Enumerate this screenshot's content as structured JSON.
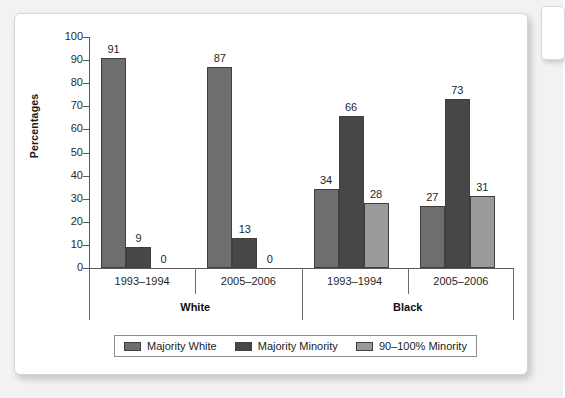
{
  "chart_data": {
    "type": "bar",
    "title": "",
    "subtitle": "",
    "xlabel": "",
    "ylabel": "Percentages",
    "ylim": [
      0,
      100
    ],
    "ytick_labels": [
      "100",
      "90",
      "80",
      "70",
      "60",
      "50",
      "40",
      "30",
      "20",
      "10",
      "0"
    ],
    "ytick_values": [
      100,
      90,
      80,
      70,
      60,
      50,
      40,
      30,
      20,
      10,
      0
    ],
    "grid": false,
    "legend_position": "bottom",
    "groups": [
      {
        "name": "White",
        "categories": [
          "1993–1994",
          "2005–2006"
        ]
      },
      {
        "name": "Black",
        "categories": [
          "1993–1994",
          "2005–2006"
        ]
      }
    ],
    "categories": [
      "1993–1994",
      "2005–2006",
      "1993–1994",
      "2005–2006"
    ],
    "series": [
      {
        "name": "Majority White",
        "color": "#6e6e6e",
        "values": [
          91,
          87,
          34,
          27
        ]
      },
      {
        "name": "Majority Minority",
        "color": "#474747",
        "values": [
          9,
          13,
          66,
          73
        ]
      },
      {
        "name": "90–100% Minority",
        "color": "#9a9a9a",
        "values": [
          0,
          0,
          28,
          31
        ]
      }
    ],
    "bars": [
      {
        "group": "White",
        "category": "1993–1994",
        "series": "Majority White",
        "value": 91,
        "label": "91"
      },
      {
        "group": "White",
        "category": "1993–1994",
        "series": "Majority Minority",
        "value": 9,
        "label": "9"
      },
      {
        "group": "White",
        "category": "1993–1994",
        "series": "90–100% Minority",
        "value": 0,
        "label": "0"
      },
      {
        "group": "White",
        "category": "2005–2006",
        "series": "Majority White",
        "value": 87,
        "label": "87"
      },
      {
        "group": "White",
        "category": "2005–2006",
        "series": "Majority Minority",
        "value": 13,
        "label": "13"
      },
      {
        "group": "White",
        "category": "2005–2006",
        "series": "90–100% Minority",
        "value": 0,
        "label": "0"
      },
      {
        "group": "Black",
        "category": "1993–1994",
        "series": "Majority White",
        "value": 34,
        "label": "34"
      },
      {
        "group": "Black",
        "category": "1993–1994",
        "series": "Majority Minority",
        "value": 66,
        "label": "66"
      },
      {
        "group": "Black",
        "category": "1993–1994",
        "series": "90–100% Minority",
        "value": 28,
        "label": "28"
      },
      {
        "group": "Black",
        "category": "2005–2006",
        "series": "Majority White",
        "value": 27,
        "label": "27"
      },
      {
        "group": "Black",
        "category": "2005–2006",
        "series": "Majority Minority",
        "value": 73,
        "label": "73"
      },
      {
        "group": "Black",
        "category": "2005–2006",
        "series": "90–100% Minority",
        "value": 31,
        "label": "31"
      }
    ]
  },
  "legend": {
    "items": [
      {
        "label": "Majority White",
        "color": "#6e6e6e"
      },
      {
        "label": "Majority Minority",
        "color": "#474747"
      },
      {
        "label": "90–100% Minority",
        "color": "#9a9a9a"
      }
    ]
  },
  "colors": {
    "majority_white": "#6e6e6e",
    "majority_minority": "#474747",
    "ninety_hundred_minority": "#9a9a9a",
    "axis": "#5a5a5a",
    "text": "#1f1f1f",
    "card_background": "#ffffff",
    "page_background": "#f2f2f2"
  }
}
